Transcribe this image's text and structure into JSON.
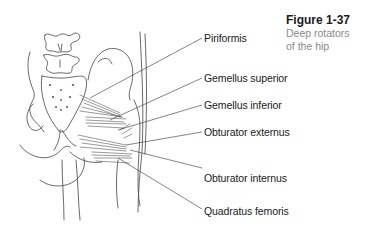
{
  "figure": {
    "title": "Figure 1-37",
    "caption_line1": "Deep rotators",
    "caption_line2": "of the hip"
  },
  "labels": [
    {
      "text": "Piriformis"
    },
    {
      "text": "Gemellus superior"
    },
    {
      "text": "Gemellus inferior"
    },
    {
      "text": "Obturator externus"
    },
    {
      "text": "Obturator internus"
    },
    {
      "text": "Quadratus femoris"
    }
  ],
  "colors": {
    "line": "#333333",
    "caption_gray": "#8a8a8a"
  }
}
